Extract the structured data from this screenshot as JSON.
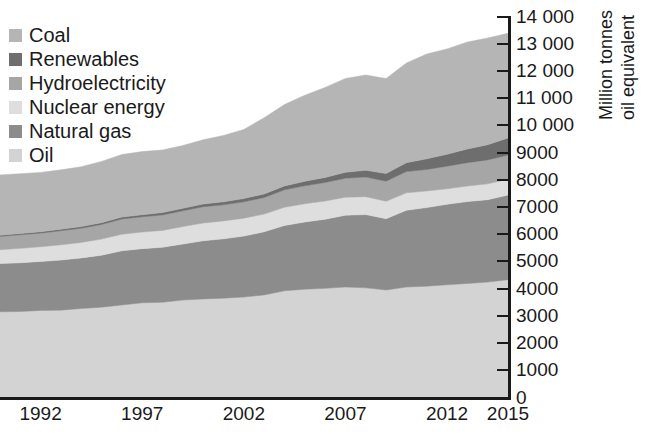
{
  "chart_data": {
    "type": "area",
    "title": "",
    "subtitle": "",
    "xlabel": "",
    "ylabel": "Million tonnes oil equivalent",
    "ylabel_lines": [
      "Million tonnes",
      "oil equivalent"
    ],
    "stacked": true,
    "grid": false,
    "legend_position": "top-left",
    "xlim": [
      1990,
      2015
    ],
    "ylim": [
      0,
      14000
    ],
    "x_tick_labels": [
      "1992",
      "1997",
      "2002",
      "2007",
      "2012",
      "2015"
    ],
    "x_ticks": [
      1992,
      1997,
      2002,
      2007,
      2012,
      2015
    ],
    "y_tick_labels": [
      "14 000",
      "13 000",
      "12 000",
      "11 000",
      "10 000",
      "9000",
      "8000",
      "7000",
      "6000",
      "5000",
      "4000",
      "3000",
      "2000",
      "1000",
      "0"
    ],
    "y_ticks": [
      14000,
      13000,
      12000,
      11000,
      10000,
      9000,
      8000,
      7000,
      6000,
      5000,
      4000,
      3000,
      2000,
      1000,
      0
    ],
    "x": [
      1990,
      1991,
      1992,
      1993,
      1994,
      1995,
      1996,
      1997,
      1998,
      1999,
      2000,
      2001,
      2002,
      2003,
      2004,
      2005,
      2006,
      2007,
      2008,
      2009,
      2010,
      2011,
      2012,
      2013,
      2014,
      2015
    ],
    "series": [
      {
        "name": "Oil",
        "color": "#d3d3d3",
        "values": [
          3150,
          3160,
          3200,
          3210,
          3270,
          3320,
          3400,
          3480,
          3500,
          3580,
          3620,
          3650,
          3690,
          3770,
          3920,
          3980,
          4010,
          4060,
          4030,
          3950,
          4060,
          4090,
          4140,
          4190,
          4240,
          4330
        ]
      },
      {
        "name": "Natural gas",
        "color": "#8c8c8c",
        "values": [
          1770,
          1790,
          1800,
          1840,
          1860,
          1910,
          1990,
          1990,
          2020,
          2060,
          2140,
          2180,
          2240,
          2320,
          2400,
          2470,
          2540,
          2640,
          2690,
          2620,
          2820,
          2890,
          2960,
          3010,
          3030,
          3110
        ]
      },
      {
        "name": "Nuclear energy",
        "color": "#dedede",
        "values": [
          510,
          530,
          540,
          560,
          570,
          590,
          610,
          610,
          620,
          640,
          650,
          660,
          660,
          650,
          670,
          670,
          670,
          660,
          660,
          640,
          640,
          610,
          570,
          570,
          580,
          580
        ]
      },
      {
        "name": "Hydroelectricity",
        "color": "#a6a6a6",
        "values": [
          490,
          500,
          500,
          520,
          520,
          540,
          560,
          560,
          570,
          580,
          600,
          590,
          600,
          610,
          640,
          660,
          680,
          700,
          720,
          740,
          780,
          790,
          830,
          860,
          880,
          890
        ]
      },
      {
        "name": "Renewables",
        "color": "#6e6e6e",
        "values": [
          40,
          45,
          50,
          55,
          60,
          65,
          70,
          75,
          85,
          90,
          100,
          110,
          120,
          130,
          145,
          165,
          185,
          215,
          250,
          280,
          330,
          390,
          440,
          500,
          560,
          630
        ]
      },
      {
        "name": "Coal",
        "color": "#b5b5b5",
        "values": [
          2220,
          2200,
          2180,
          2180,
          2200,
          2250,
          2300,
          2320,
          2300,
          2310,
          2360,
          2440,
          2540,
          2800,
          2990,
          3160,
          3310,
          3450,
          3500,
          3490,
          3660,
          3850,
          3870,
          3930,
          3920,
          3840
        ]
      }
    ]
  },
  "legend": {
    "items": [
      {
        "label": "Coal",
        "color": "#b5b5b5"
      },
      {
        "label": "Renewables",
        "color": "#6e6e6e"
      },
      {
        "label": "Hydroelectricity",
        "color": "#a6a6a6"
      },
      {
        "label": "Nuclear energy",
        "color": "#dedede"
      },
      {
        "label": "Natural gas",
        "color": "#8c8c8c"
      },
      {
        "label": "Oil",
        "color": "#d3d3d3"
      }
    ]
  },
  "colors": {
    "axis": "#1a1a1a",
    "background": "#ffffff",
    "text": "#1a1a1a"
  }
}
